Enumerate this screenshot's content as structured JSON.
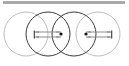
{
  "figure": {
    "canvas": {
      "width": 129,
      "height": 66,
      "background": "#ffffff"
    },
    "header_bar": {
      "name": "top-gray-bar",
      "x": 3,
      "y": 1,
      "width": 122,
      "height": 3,
      "color": "#a8a8a8"
    },
    "circles": [
      {
        "label": "circle-1",
        "cx": 26,
        "cy": 34,
        "r": 22,
        "stroke": "#b5b5b5",
        "stroke_width": 0.9
      },
      {
        "label": "circle-2",
        "cx": 48,
        "cy": 34,
        "r": 22,
        "stroke": "#3a3a3a",
        "stroke_width": 1.0
      },
      {
        "label": "circle-3",
        "cx": 74,
        "cy": 34,
        "r": 22,
        "stroke": "#3a3a3a",
        "stroke_width": 1.0
      },
      {
        "label": "circle-4",
        "cx": 98,
        "cy": 34,
        "r": 22,
        "stroke": "#b5b5b5",
        "stroke_width": 0.9
      }
    ],
    "center_points": [
      {
        "label": "center-dot-left",
        "cx": 61,
        "cy": 34,
        "r": 1.6,
        "color": "#111111"
      },
      {
        "label": "center-dot-right",
        "cx": 86,
        "cy": 34,
        "r": 1.6,
        "color": "#111111"
      }
    ],
    "dimension_arrows": [
      {
        "label": "dimension-arrow-left",
        "x1": 34,
        "x2": 61,
        "y_top": 32,
        "y_bottom": 37,
        "color": "#8c8c8c",
        "end_tick_color": "#3a3a3a"
      },
      {
        "label": "dimension-arrow-right",
        "x1": 86,
        "x2": 112,
        "y_top": 32,
        "y_bottom": 37,
        "color": "#8c8c8c",
        "end_tick_color": "#3a3a3a"
      }
    ],
    "colors": {
      "background": "#ffffff",
      "bar_gray": "#a8a8a8",
      "circle_light": "#b5b5b5",
      "circle_dark": "#3a3a3a",
      "arrow_gray": "#8c8c8c",
      "dot_black": "#111111"
    }
  }
}
